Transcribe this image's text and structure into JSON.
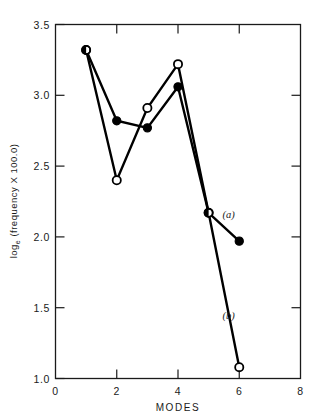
{
  "chart_data": {
    "type": "line",
    "title": "",
    "xlabel": "MODES",
    "ylabel": "log_e (frequency X 100.0)",
    "ylabel_parts": {
      "prefix": "log",
      "subscript": "e",
      "suffix": " (frequency X 100.0)"
    },
    "x": [
      1,
      2,
      3,
      4,
      5,
      6
    ],
    "xlim": [
      0,
      8
    ],
    "ylim": [
      1.0,
      3.5
    ],
    "xticks": [
      0,
      2,
      4,
      6,
      8
    ],
    "xtick_labels": [
      "0",
      "2",
      "4",
      "6",
      "8"
    ],
    "yticks": [
      1.0,
      1.5,
      2.0,
      2.5,
      3.0,
      3.5
    ],
    "ytick_labels": [
      "1.0",
      "1.5",
      "2.0",
      "2.5",
      "3.0",
      "3.5"
    ],
    "grid": false,
    "legend": "none",
    "series": [
      {
        "name": "(a)",
        "marker": "filled-circle",
        "values": [
          3.32,
          2.82,
          2.77,
          3.06,
          2.17,
          1.97
        ]
      },
      {
        "name": "(b)",
        "marker": "open-circle",
        "values": [
          3.32,
          2.4,
          2.91,
          3.22,
          2.17,
          1.08
        ]
      }
    ],
    "annotations": [
      {
        "text": "(a)",
        "x": 5.45,
        "y": 2.13
      },
      {
        "text": "(b)",
        "x": 5.45,
        "y": 1.42
      }
    ]
  }
}
